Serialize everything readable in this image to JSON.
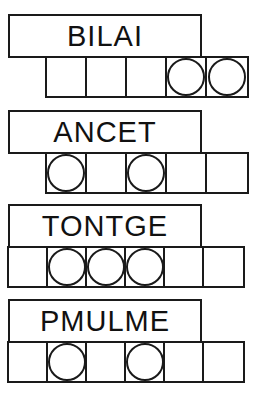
{
  "worksheet": {
    "title_visible": false,
    "ink_color": "#1a1a1a",
    "paper_color": "#ffffff",
    "puzzles": [
      {
        "id": "puzzle-1",
        "word": "BILAI",
        "word_box": {
          "left": 8,
          "top": 14,
          "width": 194,
          "height": 44
        },
        "grid": {
          "left": 45,
          "top": 56,
          "cell_count": 5,
          "cell_width": 40,
          "circled_cells": [
            4,
            5
          ],
          "cells": [
            {
              "index": 1,
              "circled": false
            },
            {
              "index": 2,
              "circled": false
            },
            {
              "index": 3,
              "circled": false
            },
            {
              "index": 4,
              "circled": true
            },
            {
              "index": 5,
              "circled": true
            }
          ]
        }
      },
      {
        "id": "puzzle-2",
        "word": "ANCET",
        "word_box": {
          "left": 8,
          "top": 110,
          "width": 194,
          "height": 44
        },
        "grid": {
          "left": 45,
          "top": 152,
          "cell_count": 5,
          "cell_width": 40,
          "circled_cells": [
            1,
            3
          ],
          "cells": [
            {
              "index": 1,
              "circled": true
            },
            {
              "index": 2,
              "circled": false
            },
            {
              "index": 3,
              "circled": true
            },
            {
              "index": 4,
              "circled": false
            },
            {
              "index": 5,
              "circled": false
            }
          ]
        }
      },
      {
        "id": "puzzle-3",
        "word": "TONTGE",
        "word_box": {
          "left": 8,
          "top": 204,
          "width": 194,
          "height": 44
        },
        "grid": {
          "left": 7,
          "top": 246,
          "cell_count": 6,
          "cell_width": 39,
          "circled_cells": [
            2,
            3,
            4
          ],
          "cells": [
            {
              "index": 1,
              "circled": false
            },
            {
              "index": 2,
              "circled": true
            },
            {
              "index": 3,
              "circled": true
            },
            {
              "index": 4,
              "circled": true
            },
            {
              "index": 5,
              "circled": false
            },
            {
              "index": 6,
              "circled": false
            }
          ]
        }
      },
      {
        "id": "puzzle-4",
        "word": "PMULME",
        "word_box": {
          "left": 8,
          "top": 299,
          "width": 194,
          "height": 44
        },
        "grid": {
          "left": 7,
          "top": 341,
          "cell_count": 6,
          "cell_width": 39,
          "circled_cells": [
            2,
            4
          ],
          "cells": [
            {
              "index": 1,
              "circled": false
            },
            {
              "index": 2,
              "circled": true
            },
            {
              "index": 3,
              "circled": false
            },
            {
              "index": 4,
              "circled": true
            },
            {
              "index": 5,
              "circled": false
            },
            {
              "index": 6,
              "circled": false
            }
          ]
        }
      }
    ]
  }
}
